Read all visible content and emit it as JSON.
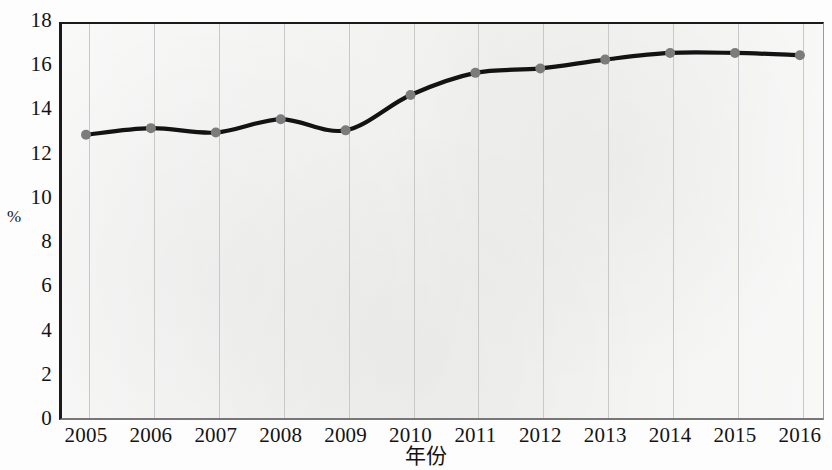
{
  "chart_data": {
    "type": "line",
    "title": "",
    "xlabel": "年份",
    "ylabel": "%",
    "categories": [
      "2005",
      "2006",
      "2007",
      "2008",
      "2009",
      "2010",
      "2011",
      "2012",
      "2013",
      "2014",
      "2015",
      "2016"
    ],
    "values": [
      12.9,
      13.2,
      13.0,
      13.6,
      13.1,
      14.7,
      15.7,
      15.9,
      16.3,
      16.6,
      16.6,
      16.5
    ],
    "series": [
      {
        "name": "",
        "values": [
          12.9,
          13.2,
          13.0,
          13.6,
          13.1,
          14.7,
          15.7,
          15.9,
          16.3,
          16.6,
          16.6,
          16.5
        ]
      }
    ],
    "ylim": [
      0,
      18
    ],
    "yticks": [
      0,
      2,
      4,
      6,
      8,
      10,
      12,
      14,
      16,
      18
    ],
    "ytick_labels": [
      "0",
      "2",
      "4",
      "6",
      "8",
      "10",
      "12",
      "14",
      "16",
      "18"
    ],
    "xtick_labels": [
      "2005",
      "2006",
      "2007",
      "2008",
      "2009",
      "2010",
      "2011",
      "2012",
      "2013",
      "2014",
      "2015",
      "2016"
    ],
    "grid": "vertical",
    "legend": "none",
    "line_color": "#131313",
    "marker_color": "#7c7c7c",
    "plot_background": "#f4f4f3",
    "axis_color": "#1a1a1a",
    "gridline_color": "#c8c8c8"
  }
}
